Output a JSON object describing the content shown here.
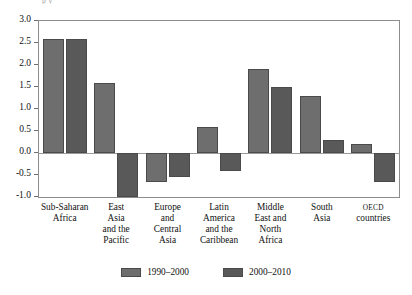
{
  "figure": {
    "top_clipped_caption": "p  y",
    "background_color": "#ffffff"
  },
  "chart_data": {
    "type": "bar",
    "title": "",
    "subtitle": "",
    "xlabel": "",
    "ylabel": "",
    "ylim": [
      -1.0,
      3.0
    ],
    "ytick_labels": [
      "3.0",
      "2.5",
      "2.0",
      "1.5",
      "1.0",
      "0.5",
      "0.0",
      "-0.5",
      "-1.0"
    ],
    "ytick_values": [
      3.0,
      2.5,
      2.0,
      1.5,
      1.0,
      0.5,
      0.0,
      -0.5,
      -1.0
    ],
    "grid": false,
    "zero_line": true,
    "legend_position": "bottom",
    "categories": [
      "Sub-Saharan Africa",
      "East Asia and the Pacific",
      "Europe and Central Asia",
      "Latin America and the Caribbean",
      "Middle East and North Africa",
      "South Asia",
      "OECD countries"
    ],
    "category_lines": [
      [
        "Sub-Saharan",
        "Africa"
      ],
      [
        "East",
        "Asia",
        "and the",
        "Pacific"
      ],
      [
        "Europe",
        "and",
        "Central",
        "Asia"
      ],
      [
        "Latin",
        "America",
        "and the",
        "Caribbean"
      ],
      [
        "Middle",
        "East and",
        "North",
        "Africa"
      ],
      [
        "South",
        "Asia"
      ],
      [
        "OECD",
        "countries"
      ]
    ],
    "series": [
      {
        "name": "1990–2000",
        "color": "#6e6e6e",
        "values": [
          2.6,
          1.6,
          -0.65,
          0.6,
          1.9,
          1.3,
          0.2
        ]
      },
      {
        "name": "2000–2010",
        "color": "#595959",
        "values": [
          2.6,
          -1.0,
          -0.55,
          -0.4,
          1.5,
          0.3,
          -0.65
        ]
      }
    ]
  },
  "legend": {
    "items": [
      {
        "label": "1990–2000",
        "color": "#6e6e6e"
      },
      {
        "label": "2000–2010",
        "color": "#595959"
      }
    ]
  }
}
